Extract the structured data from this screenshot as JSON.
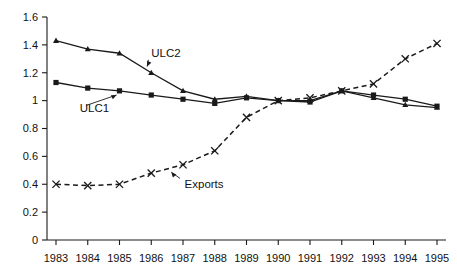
{
  "chart_data": {
    "type": "line",
    "title": "",
    "subtitle": "",
    "xlabel": "",
    "ylabel": "",
    "categories": [
      "1983",
      "1984",
      "1985",
      "1986",
      "1987",
      "1988",
      "1989",
      "1990",
      "1991",
      "1992",
      "1993",
      "1994",
      "1995"
    ],
    "x": [
      1983,
      1984,
      1985,
      1986,
      1987,
      1988,
      1989,
      1990,
      1991,
      1992,
      1993,
      1994,
      1995
    ],
    "ylim": [
      0,
      1.6
    ],
    "ytick_labels": [
      "0",
      "0.2",
      "0.4",
      "0.6",
      "0.8",
      "1",
      "1.2",
      "1.4",
      "1.6"
    ],
    "ytick_values": [
      0,
      0.2,
      0.4,
      0.6,
      0.8,
      1,
      1.2,
      1.4,
      1.6
    ],
    "grid": false,
    "legend": "none (inline annotated labels)",
    "series": [
      {
        "name": "ULC1",
        "style": "solid",
        "marker": "square",
        "color": "#1a1a1a",
        "values": [
          1.13,
          1.09,
          1.07,
          1.04,
          1.01,
          0.98,
          1.02,
          1.0,
          0.99,
          1.07,
          1.04,
          1.01,
          0.96
        ]
      },
      {
        "name": "ULC2",
        "style": "solid",
        "marker": "triangle",
        "color": "#1a1a1a",
        "values": [
          1.43,
          1.37,
          1.34,
          1.2,
          1.07,
          1.01,
          1.03,
          1.0,
          1.0,
          1.07,
          1.02,
          0.97,
          0.95
        ]
      },
      {
        "name": "Exports",
        "style": "dashed",
        "marker": "x",
        "color": "#1a1a1a",
        "values": [
          0.4,
          0.39,
          0.4,
          0.48,
          0.54,
          0.64,
          0.88,
          1.0,
          1.02,
          1.07,
          1.12,
          1.3,
          1.41
        ]
      }
    ],
    "annotations": [
      {
        "text": "ULC2",
        "label_x": 1986.0,
        "label_y": 1.31,
        "target_x": 1985.85,
        "target_y": 1.235
      },
      {
        "text": "ULC1",
        "label_x": 1983.75,
        "label_y": 0.915,
        "target_x": 1984.95,
        "target_y": 1.045
      },
      {
        "text": "Exports",
        "label_x": 1987.05,
        "label_y": 0.375,
        "target_x": 1986.6,
        "target_y": 0.495
      }
    ]
  }
}
